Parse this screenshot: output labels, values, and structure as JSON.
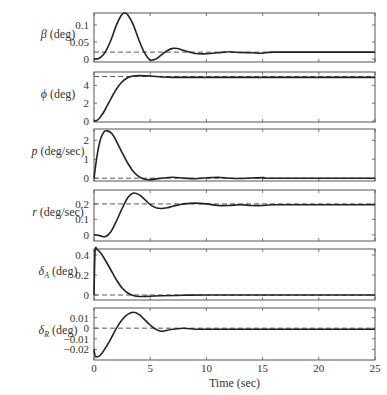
{
  "chart_data": [
    {
      "type": "line",
      "ylabel_symbol": "β",
      "ylabel_unit": " (deg)",
      "yticks": [
        "0",
        "0.05",
        "0.1"
      ],
      "ylim": [
        -0.009,
        0.135
      ],
      "reference": 0.02,
      "x": [
        0,
        0.3,
        0.6,
        1.0,
        1.5,
        2.0,
        2.4,
        2.7,
        3.0,
        3.5,
        4.0,
        4.5,
        5.0,
        5.5,
        6.0,
        6.5,
        7.0,
        7.5,
        8.0,
        8.5,
        9.0,
        10.0,
        11.0,
        12.0,
        13.0,
        14.0,
        15.0,
        16.0,
        20.0,
        25.0
      ],
      "values": [
        0,
        0,
        0.005,
        0.02,
        0.055,
        0.1,
        0.127,
        0.135,
        0.13,
        0.1,
        0.055,
        0.018,
        -0.003,
        0.0,
        0.012,
        0.024,
        0.031,
        0.03,
        0.025,
        0.02,
        0.016,
        0.015,
        0.018,
        0.021,
        0.019,
        0.018,
        0.017,
        0.02,
        0.02,
        0.02
      ]
    },
    {
      "type": "line",
      "ylabel_symbol": "ϕ",
      "ylabel_unit": " (deg)",
      "yticks": [
        "0",
        "2",
        "4"
      ],
      "ylim": [
        -0.1,
        5.5
      ],
      "reference": 5,
      "x": [
        0,
        0.3,
        0.6,
        1.0,
        1.5,
        2.0,
        2.5,
        3.0,
        3.5,
        4.0,
        5.0,
        6.0,
        7.0,
        8.0,
        10.0,
        25.0
      ],
      "values": [
        0,
        0.1,
        0.5,
        1.3,
        2.5,
        3.6,
        4.4,
        4.85,
        5.05,
        5.1,
        5.05,
        4.95,
        4.9,
        4.9,
        4.9,
        4.9
      ]
    },
    {
      "type": "line",
      "ylabel_symbol": "p",
      "ylabel_unit": " (deg/sec)",
      "yticks": [
        "0",
        "1",
        "2"
      ],
      "ylim": [
        -0.15,
        2.6
      ],
      "reference": 0,
      "x": [
        0,
        0.3,
        0.6,
        0.9,
        1.2,
        1.6,
        2.0,
        2.5,
        3.0,
        3.5,
        4.0,
        4.5,
        5.0,
        5.5,
        6.0,
        7.0,
        8.0,
        9.0,
        10.0,
        11.0,
        12.0,
        13.0,
        15.0,
        16.0,
        25.0
      ],
      "values": [
        0,
        1.3,
        2.1,
        2.45,
        2.5,
        2.35,
        1.95,
        1.35,
        0.8,
        0.35,
        0.08,
        -0.06,
        -0.08,
        -0.04,
        0.0,
        0.05,
        0.0,
        -0.03,
        0.02,
        0.05,
        0.0,
        -0.02,
        0.03,
        0.0,
        0.0
      ]
    },
    {
      "type": "line",
      "ylabel_symbol": "r",
      "ylabel_unit": " (deg/sec)",
      "yticks": [
        "0",
        "0.1",
        "0.2"
      ],
      "ylim": [
        -0.04,
        0.29
      ],
      "reference": 0.2,
      "x": [
        0,
        0.5,
        1.0,
        1.5,
        2.0,
        2.5,
        3.0,
        3.5,
        4.0,
        4.5,
        5.0,
        5.5,
        6.0,
        6.5,
        7.0,
        8.0,
        9.0,
        10.0,
        11.0,
        12.0,
        13.0,
        14.0,
        15.0,
        16.0,
        20.0,
        25.0
      ],
      "values": [
        0,
        -0.005,
        -0.012,
        0.02,
        0.09,
        0.17,
        0.24,
        0.27,
        0.26,
        0.23,
        0.195,
        0.175,
        0.17,
        0.175,
        0.185,
        0.2,
        0.205,
        0.2,
        0.19,
        0.19,
        0.195,
        0.19,
        0.19,
        0.195,
        0.195,
        0.195
      ]
    },
    {
      "type": "line",
      "ylabel_symbol": "δ",
      "ylabel_sub": "A",
      "ylabel_unit": " (deg)",
      "yticks": [
        "0",
        "0.2",
        "0.4"
      ],
      "ylim": [
        -0.05,
        0.46
      ],
      "reference": 0,
      "x": [
        0,
        0.1,
        0.3,
        0.6,
        1.0,
        1.5,
        2.0,
        2.5,
        3.0,
        3.5,
        4.0,
        5.0,
        6.0,
        8.0,
        10.0,
        25.0
      ],
      "values": [
        0,
        0.44,
        0.45,
        0.42,
        0.35,
        0.25,
        0.15,
        0.07,
        0.02,
        -0.005,
        -0.015,
        -0.012,
        -0.008,
        -0.003,
        0.0,
        0.0
      ]
    },
    {
      "type": "line",
      "ylabel_symbol": "δ",
      "ylabel_sub": "R",
      "ylabel_unit": " (deg)",
      "yticks": [
        "0.01",
        "0",
        "−0.01",
        "−0.02"
      ],
      "ylim": [
        -0.03,
        0.019
      ],
      "reference": 0,
      "x": [
        0,
        0.1,
        0.3,
        0.6,
        1.0,
        1.5,
        2.0,
        2.5,
        3.0,
        3.5,
        4.0,
        4.5,
        5.0,
        5.5,
        6.0,
        6.5,
        7.0,
        8.0,
        9.0,
        10.0,
        12.0,
        25.0
      ],
      "values": [
        -0.02,
        -0.026,
        -0.027,
        -0.025,
        -0.019,
        -0.01,
        0.0,
        0.008,
        0.013,
        0.015,
        0.013,
        0.008,
        0.003,
        -0.001,
        -0.003,
        -0.002,
        -0.001,
        0.0,
        -0.001,
        -0.001,
        -0.001,
        -0.001
      ]
    }
  ],
  "xaxis": {
    "label": "Time (sec)",
    "ticks": [
      "0",
      "5",
      "10",
      "15",
      "20",
      "25"
    ],
    "xlim": [
      0,
      25
    ]
  }
}
